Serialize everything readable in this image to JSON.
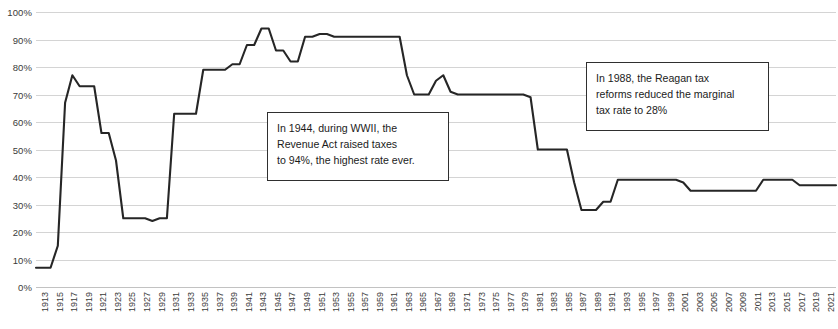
{
  "chart_data": {
    "type": "line",
    "title": "",
    "subtitle": "",
    "xlabel": "",
    "ylabel": "",
    "ylim": [
      0,
      100
    ],
    "xlim": [
      1913,
      2023
    ],
    "grid": true,
    "legend": "none",
    "y_ticks": [
      "0%",
      "10%",
      "20%",
      "30%",
      "40%",
      "50%",
      "60%",
      "70%",
      "80%",
      "90%",
      "100%"
    ],
    "y_tick_values": [
      0,
      10,
      20,
      30,
      40,
      50,
      60,
      70,
      80,
      90,
      100
    ],
    "x_tick_labels": [
      "1913",
      "1915",
      "1917",
      "1919",
      "1921",
      "1923",
      "1925",
      "1927",
      "1929",
      "1931",
      "1933",
      "1935",
      "1937",
      "1939",
      "1941",
      "1943",
      "1945",
      "1947",
      "1949",
      "1951",
      "1953",
      "1955",
      "1957",
      "1959",
      "1961",
      "1963",
      "1965",
      "1967",
      "1969",
      "1971",
      "1973",
      "1975",
      "1977",
      "1979",
      "1981",
      "1983",
      "1985",
      "1987",
      "1989",
      "1991",
      "1993",
      "1995",
      "1997",
      "1999",
      "2001",
      "2003",
      "2005",
      "2007",
      "2009",
      "2011",
      "2013",
      "2015",
      "2017",
      "2019",
      "2021",
      "2023"
    ],
    "series": [
      {
        "name": "Top marginal tax rate",
        "color": "#262626",
        "x": [
          1913,
          1914,
          1915,
          1916,
          1917,
          1918,
          1919,
          1920,
          1921,
          1922,
          1923,
          1924,
          1925,
          1926,
          1927,
          1928,
          1929,
          1930,
          1931,
          1932,
          1933,
          1934,
          1935,
          1936,
          1937,
          1938,
          1939,
          1940,
          1941,
          1942,
          1943,
          1944,
          1945,
          1946,
          1947,
          1948,
          1949,
          1950,
          1951,
          1952,
          1953,
          1954,
          1955,
          1956,
          1957,
          1958,
          1959,
          1960,
          1961,
          1962,
          1963,
          1964,
          1965,
          1966,
          1967,
          1968,
          1969,
          1970,
          1971,
          1972,
          1973,
          1974,
          1975,
          1976,
          1977,
          1978,
          1979,
          1980,
          1981,
          1982,
          1983,
          1984,
          1985,
          1986,
          1987,
          1988,
          1989,
          1990,
          1991,
          1992,
          1993,
          1994,
          1995,
          1996,
          1997,
          1998,
          1999,
          2000,
          2001,
          2002,
          2003,
          2004,
          2005,
          2006,
          2007,
          2008,
          2009,
          2010,
          2011,
          2012,
          2013,
          2014,
          2015,
          2016,
          2017,
          2018,
          2019,
          2020,
          2021,
          2022,
          2023
        ],
        "values": [
          7,
          7,
          7,
          15,
          67,
          77,
          73,
          73,
          73,
          56,
          56,
          46,
          25,
          25,
          25,
          25,
          24,
          25,
          25,
          63,
          63,
          63,
          63,
          79,
          79,
          79,
          79,
          81,
          81,
          88,
          88,
          94,
          94,
          86,
          86,
          82,
          82,
          91,
          91,
          92,
          92,
          91,
          91,
          91,
          91,
          91,
          91,
          91,
          91,
          91,
          91,
          77,
          70,
          70,
          70,
          75,
          77,
          71,
          70,
          70,
          70,
          70,
          70,
          70,
          70,
          70,
          70,
          70,
          69,
          50,
          50,
          50,
          50,
          50,
          38,
          28,
          28,
          28,
          31,
          31,
          39,
          39,
          39,
          39,
          39,
          39,
          39,
          39,
          39,
          38,
          35,
          35,
          35,
          35,
          35,
          35,
          35,
          35,
          35,
          35,
          39,
          39,
          39,
          39,
          39,
          37,
          37,
          37,
          37,
          37,
          37
        ]
      }
    ],
    "annotations": [
      {
        "id": "annotation-1944",
        "lines": [
          "In 1944, during WWII, the",
          "Revenue Act raised taxes",
          "to 94%, the highest rate ever."
        ],
        "text": "In 1944, during WWII, the Revenue Act raised taxes to 94%, the highest rate ever.",
        "box": {
          "left": 267,
          "top": 112,
          "width": 182,
          "height": 69
        }
      },
      {
        "id": "annotation-1988",
        "lines": [
          "In 1988, the Reagan tax",
          "reforms reduced the marginal",
          "tax rate to 28%"
        ],
        "text": "In 1988, the Reagan tax reforms reduced the marginal tax rate to 28%",
        "box": {
          "left": 586,
          "top": 62,
          "width": 183,
          "height": 69
        }
      }
    ],
    "colors": {
      "line": "#262626",
      "gridline": "#d4d4d4",
      "axis_text": "#3a3a3a",
      "annotation_border": "#2f2f2f",
      "background": "#ffffff"
    }
  }
}
